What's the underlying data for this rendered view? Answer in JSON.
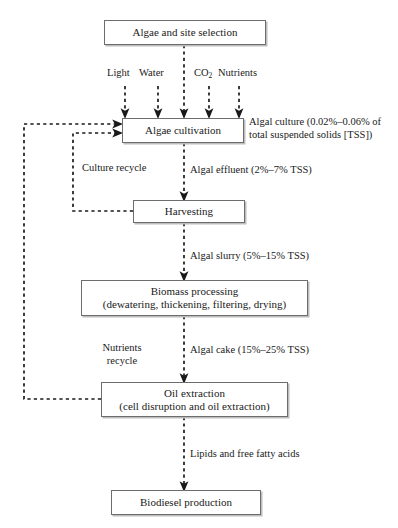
{
  "diagram": {
    "nodes": [
      {
        "id": "site-selection",
        "label": "Algae and site selection"
      },
      {
        "id": "algae-cultivation",
        "label": "Algae cultivation"
      },
      {
        "id": "harvesting",
        "label": "Harvesting"
      },
      {
        "id": "biomass-processing",
        "label_line1": "Biomass processing",
        "label_line2": "(dewatering, thickening, filtering, drying)"
      },
      {
        "id": "oil-extraction",
        "label_line1": "Oil extraction",
        "label_line2": "(cell disruption and oil extraction)"
      },
      {
        "id": "biodiesel-production",
        "label": "Biodiesel production"
      }
    ],
    "inputs": [
      {
        "id": "light",
        "label": "Light"
      },
      {
        "id": "water",
        "label": "Water"
      },
      {
        "id": "co2",
        "label": "CO",
        "subscript": "2"
      },
      {
        "id": "nutrients",
        "label": "Nutrients"
      }
    ],
    "edge_labels": [
      {
        "id": "algal-culture",
        "line1": "Algal culture (0.02%–0.06% of",
        "line2": "total suspended solids [TSS])"
      },
      {
        "id": "algal-effluent",
        "text": "Algal effluent (2%–7% TSS)"
      },
      {
        "id": "algal-slurry",
        "text": "Algal slurry (5%–15% TSS)"
      },
      {
        "id": "algal-cake",
        "text": "Algal cake (15%–25% TSS)"
      },
      {
        "id": "lipids",
        "text": "Lipids and free fatty acids"
      },
      {
        "id": "culture-recycle",
        "text": "Culture recycle"
      },
      {
        "id": "nutrients-recycle",
        "line1": "Nutrients",
        "line2": "recycle"
      }
    ],
    "colors": {
      "box_border": "#6d6d6d",
      "box_shadow": "#bdbdbd",
      "arrow": "#1a1a1a",
      "text": "#1a1a1a",
      "background": "#ffffff"
    }
  }
}
